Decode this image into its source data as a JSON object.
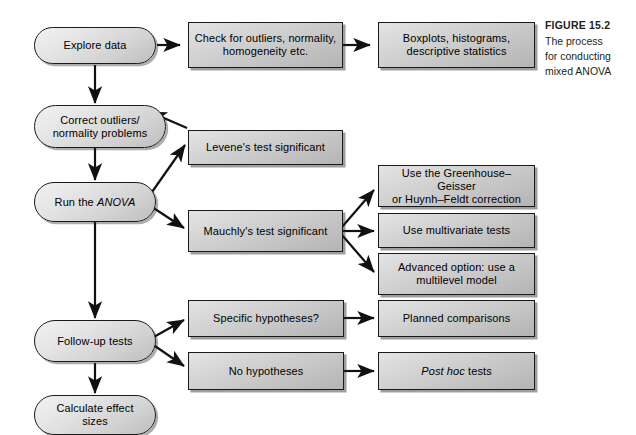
{
  "figure": {
    "caption_title": "FIGURE 15.2",
    "caption_lines": [
      "The process",
      "for conducting",
      "mixed ANOVA"
    ]
  },
  "colors": {
    "page_background": "#ffffff",
    "box_fill_light": "#e4e4e4",
    "box_fill_dark": "#b4b4b4",
    "border": "#1a1a1a",
    "text": "#000000",
    "caption_text": "#231f20"
  },
  "nodes": {
    "explore_data": {
      "text": "Explore data",
      "shape": "rounded"
    },
    "check_outliers": {
      "line1": "Check for outliers, normality,",
      "line2": "homogeneity etc.",
      "shape": "rect"
    },
    "boxplots": {
      "line1": "Boxplots, histograms,",
      "line2": "descriptive statistics",
      "shape": "rect"
    },
    "correct_outliers": {
      "line1": "Correct outliers/",
      "line2": "normality problems",
      "shape": "rounded"
    },
    "levenes": {
      "text": "Levene's test significant",
      "shape": "rect"
    },
    "run_anova": {
      "prefix": "Run the ",
      "italic": "ANOVA",
      "shape": "rounded"
    },
    "mauchlys": {
      "text": "Mauchly's test significant",
      "shape": "rect"
    },
    "greenhouse": {
      "line1": "Use the Greenhouse–Geisser",
      "line2": "or Huynh–Feldt correction",
      "shape": "rect"
    },
    "multivariate": {
      "text": "Use multivariate tests",
      "shape": "rect"
    },
    "multilevel": {
      "line1": "Advanced option: use a",
      "line2": "multilevel model",
      "shape": "rect"
    },
    "follow_up": {
      "text": "Follow-up tests",
      "shape": "rounded"
    },
    "specific_hypotheses": {
      "text": "Specific hypotheses?",
      "shape": "rect"
    },
    "planned_comparisons": {
      "text": "Planned comparisons",
      "shape": "rect"
    },
    "no_hypotheses": {
      "text": "No hypotheses",
      "shape": "rect"
    },
    "post_hoc": {
      "italic": "Post hoc",
      "suffix": " tests",
      "shape": "rect"
    },
    "calculate_effect": {
      "line1": "Calculate effect",
      "line2": "sizes",
      "shape": "rounded"
    }
  },
  "edges": [
    {
      "from": "explore_data",
      "to": "check_outliers",
      "style": "straight-right"
    },
    {
      "from": "check_outliers",
      "to": "boxplots",
      "style": "straight-right"
    },
    {
      "from": "explore_data",
      "to": "correct_outliers",
      "style": "straight-down"
    },
    {
      "from": "correct_outliers",
      "to": "run_anova",
      "style": "straight-down"
    },
    {
      "from": "run_anova",
      "to": "levenes",
      "style": "diagonal-up-right"
    },
    {
      "from": "levenes",
      "to": "correct_outliers",
      "style": "diagonal-up-left-feedback"
    },
    {
      "from": "run_anova",
      "to": "mauchlys",
      "style": "diagonal-down-right"
    },
    {
      "from": "mauchlys",
      "to": "greenhouse",
      "style": "diagonal-up-right"
    },
    {
      "from": "mauchlys",
      "to": "multivariate",
      "style": "straight-right"
    },
    {
      "from": "mauchlys",
      "to": "multilevel",
      "style": "diagonal-down-right"
    },
    {
      "from": "run_anova",
      "to": "follow_up",
      "style": "straight-down"
    },
    {
      "from": "follow_up",
      "to": "specific_hypotheses",
      "style": "diagonal-up-right"
    },
    {
      "from": "follow_up",
      "to": "no_hypotheses",
      "style": "diagonal-down-right"
    },
    {
      "from": "specific_hypotheses",
      "to": "planned_comparisons",
      "style": "straight-right"
    },
    {
      "from": "no_hypotheses",
      "to": "post_hoc",
      "style": "straight-right"
    },
    {
      "from": "follow_up",
      "to": "calculate_effect",
      "style": "straight-down"
    }
  ]
}
